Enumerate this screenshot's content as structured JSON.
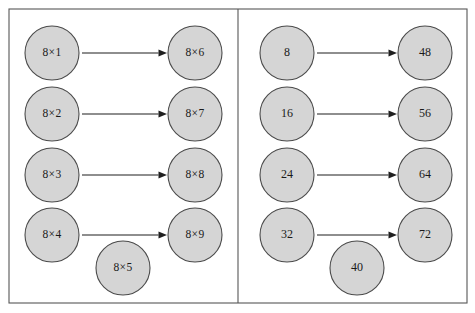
{
  "figure": {
    "type": "matching-diagram",
    "panel_count": 2,
    "colors": {
      "circle_fill": "#d5d5d5",
      "circle_stroke": "#4a4a4a",
      "frame_stroke": "#575757",
      "arrow_stroke": "#1f1f1f",
      "background": "#ffffff",
      "text": "#1a1a1a"
    },
    "frame": {
      "x": 9,
      "y": 9,
      "width": 458,
      "height": 294,
      "divider_x": 238
    }
  },
  "panels": [
    {
      "id": "left-panel",
      "name": "expression-panel",
      "left_column": [
        {
          "id": "l-a1",
          "label": "8×1",
          "cx": 52,
          "cy": 53,
          "r": 27
        },
        {
          "id": "l-a2",
          "label": "8×2",
          "cx": 52,
          "cy": 114,
          "r": 27
        },
        {
          "id": "l-a3",
          "label": "8×3",
          "cx": 52,
          "cy": 175,
          "r": 27
        },
        {
          "id": "l-a4",
          "label": "8×4",
          "cx": 52,
          "cy": 235,
          "r": 27
        }
      ],
      "unmatched": [
        {
          "id": "l-a5",
          "label": "8×5",
          "cx": 123,
          "cy": 268,
          "r": 27
        }
      ],
      "right_column": [
        {
          "id": "l-b6",
          "label": "8×6",
          "cx": 195,
          "cy": 53,
          "r": 27
        },
        {
          "id": "l-b7",
          "label": "8×7",
          "cx": 195,
          "cy": 114,
          "r": 27
        },
        {
          "id": "l-b8",
          "label": "8×8",
          "cx": 195,
          "cy": 175,
          "r": 27
        },
        {
          "id": "l-b9",
          "label": "8×9",
          "cx": 195,
          "cy": 235,
          "r": 27
        }
      ],
      "links": [
        {
          "id": "l-link-1",
          "from": "l-a1",
          "to": "l-b6",
          "x1": 82,
          "x2": 167,
          "y": 53
        },
        {
          "id": "l-link-2",
          "from": "l-a2",
          "to": "l-b7",
          "x1": 82,
          "x2": 167,
          "y": 114
        },
        {
          "id": "l-link-3",
          "from": "l-a3",
          "to": "l-b8",
          "x1": 82,
          "x2": 167,
          "y": 175
        },
        {
          "id": "l-link-4",
          "from": "l-a4",
          "to": "l-b9",
          "x1": 82,
          "x2": 167,
          "y": 235
        }
      ]
    },
    {
      "id": "right-panel",
      "name": "product-panel",
      "left_column": [
        {
          "id": "r-a1",
          "label": "8",
          "cx": 287,
          "cy": 53,
          "r": 27
        },
        {
          "id": "r-a2",
          "label": "16",
          "cx": 287,
          "cy": 114,
          "r": 27
        },
        {
          "id": "r-a3",
          "label": "24",
          "cx": 287,
          "cy": 175,
          "r": 27
        },
        {
          "id": "r-a4",
          "label": "32",
          "cx": 287,
          "cy": 235,
          "r": 27
        }
      ],
      "unmatched": [
        {
          "id": "r-a5",
          "label": "40",
          "cx": 357,
          "cy": 268,
          "r": 27
        }
      ],
      "right_column": [
        {
          "id": "r-b6",
          "label": "48",
          "cx": 425,
          "cy": 53,
          "r": 27
        },
        {
          "id": "r-b7",
          "label": "56",
          "cx": 425,
          "cy": 114,
          "r": 27
        },
        {
          "id": "r-b8",
          "label": "64",
          "cx": 425,
          "cy": 175,
          "r": 27
        },
        {
          "id": "r-b9",
          "label": "72",
          "cx": 425,
          "cy": 235,
          "r": 27
        }
      ],
      "links": [
        {
          "id": "r-link-1",
          "from": "r-a1",
          "to": "r-b6",
          "x1": 317,
          "x2": 397,
          "y": 53
        },
        {
          "id": "r-link-2",
          "from": "r-a2",
          "to": "r-b7",
          "x1": 317,
          "x2": 397,
          "y": 114
        },
        {
          "id": "r-link-3",
          "from": "r-a3",
          "to": "r-b8",
          "x1": 317,
          "x2": 397,
          "y": 175
        },
        {
          "id": "r-link-4",
          "from": "r-a4",
          "to": "r-b9",
          "x1": 317,
          "x2": 397,
          "y": 235
        }
      ]
    }
  ]
}
